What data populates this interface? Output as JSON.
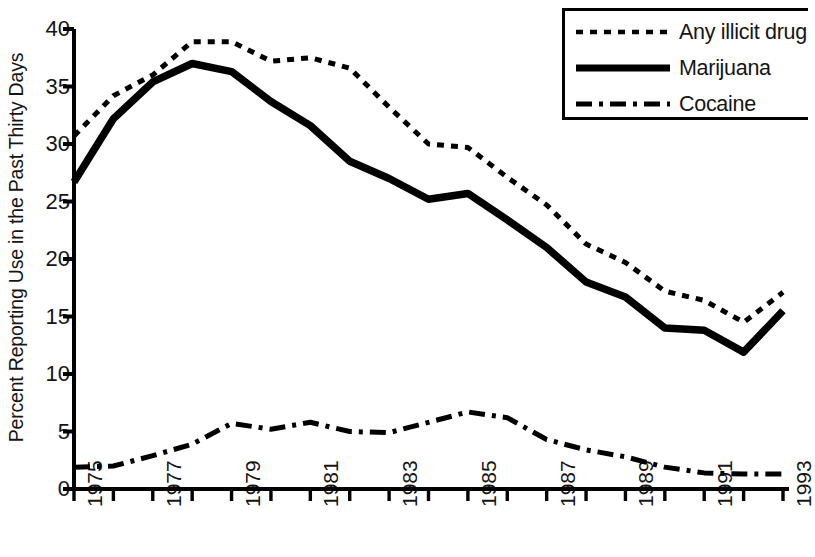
{
  "chart_data": {
    "type": "line",
    "title": "",
    "xlabel": "",
    "ylabel": "Percent Reporting Use in the Past Thirty Days",
    "x": [
      1975,
      1976,
      1977,
      1978,
      1979,
      1980,
      1981,
      1982,
      1983,
      1984,
      1985,
      1986,
      1987,
      1988,
      1989,
      1990,
      1991,
      1992,
      1993
    ],
    "xlim": [
      1975,
      1993
    ],
    "ylim": [
      0,
      40
    ],
    "yticks": [
      0,
      5,
      10,
      15,
      20,
      25,
      30,
      35,
      40
    ],
    "xtick_labels": [
      "1975",
      "1977",
      "1979",
      "1981",
      "1983",
      "1985",
      "1987",
      "1989",
      "1991",
      "1993"
    ],
    "xtick_values": [
      1975,
      1977,
      1979,
      1981,
      1983,
      1985,
      1987,
      1989,
      1991,
      1993
    ],
    "grid": false,
    "legend_position": "top-right",
    "series": [
      {
        "name": "Any illicit drug",
        "style": "dotted",
        "values": [
          30.7,
          34.2,
          36.0,
          38.9,
          38.9,
          37.2,
          37.5,
          36.6,
          33.2,
          30.0,
          29.7,
          27.1,
          24.7,
          21.3,
          19.7,
          17.2,
          16.4,
          14.5,
          17.1
        ]
      },
      {
        "name": "Marijuana",
        "style": "solid",
        "values": [
          26.7,
          32.2,
          35.4,
          37.0,
          36.3,
          33.7,
          31.6,
          28.5,
          27.0,
          25.2,
          25.7,
          23.4,
          21.0,
          18.0,
          16.7,
          14.0,
          13.8,
          11.9,
          15.5
        ]
      },
      {
        "name": "Cocaine",
        "style": "dashdot",
        "values": [
          1.9,
          2.0,
          2.9,
          3.9,
          5.7,
          5.2,
          5.8,
          5.0,
          4.9,
          5.8,
          6.7,
          6.2,
          4.3,
          3.4,
          2.8,
          1.9,
          1.4,
          1.3,
          1.3
        ]
      }
    ]
  },
  "legend": {
    "entries": [
      {
        "label": "Any illicit drug",
        "style": "dotted"
      },
      {
        "label": "Marijuana",
        "style": "solid"
      },
      {
        "label": "Cocaine",
        "style": "dashdot"
      }
    ]
  },
  "axes": {
    "y_title": "Percent Reporting Use in the Past Thirty Days",
    "y_tick_labels": [
      "40",
      "35",
      "30",
      "25",
      "20",
      "15",
      "10",
      "5",
      "0"
    ],
    "x_tick_labels": [
      "1975",
      "1977",
      "1979",
      "1981",
      "1983",
      "1985",
      "1987",
      "1989",
      "1991",
      "1993"
    ]
  },
  "colors": {
    "line": "#000000",
    "axis": "#000000",
    "background": "#ffffff"
  }
}
